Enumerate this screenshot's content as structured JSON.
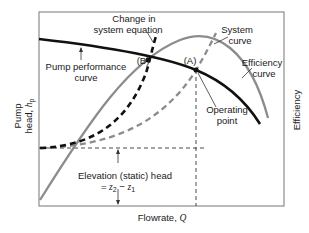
{
  "diagram": {
    "type": "pump-system-curve",
    "axes": {
      "x_label": "Flowrate, ",
      "x_symbol": "Q",
      "y_left_label_line1": "Pump",
      "y_left_label_line2": "head, ",
      "y_left_symbol": "h",
      "y_left_subscript": "p",
      "y_right_label": "Efficiency"
    },
    "annotations": {
      "change_line1": "Change in",
      "change_line2": "system equation",
      "pump_line1": "Pump performance",
      "pump_line2": "curve",
      "system_line1": "System",
      "system_line2": "curve",
      "efficiency_line1": "Efficiency",
      "efficiency_line2": "curve",
      "operating_line1": "Operating",
      "operating_line2": "point",
      "point_a": "(A)",
      "point_b": "(B)",
      "elevation_line1": "Elevation (static) head",
      "elevation_eq_prefix": "= ",
      "elevation_z2": "z",
      "elevation_sub2": "2",
      "elevation_minus": " − ",
      "elevation_z1": "z",
      "elevation_sub1": "1"
    },
    "colors": {
      "pump_curve": "#111111",
      "system_curve": "#8c8c8c",
      "changed_system_curve": "#111111",
      "efficiency_curve": "#8c8c8c",
      "frame": "#8c8c8c"
    }
  }
}
